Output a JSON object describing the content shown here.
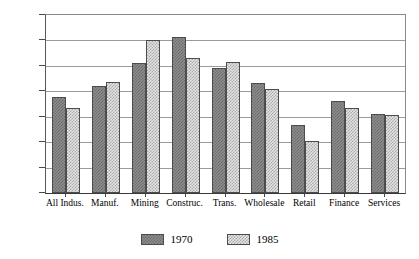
{
  "chart_data": {
    "type": "bar",
    "title": "",
    "xlabel": "",
    "ylabel": "",
    "ylim": [
      0,
      350
    ],
    "grid": true,
    "legend_position": "bottom-center",
    "y_axis_prefix": "$",
    "y_ticks": [
      0,
      50,
      100,
      150,
      200,
      250,
      300,
      350
    ],
    "y_tick_labels": [
      "0",
      "50",
      "100",
      "150",
      "200",
      "250",
      "300",
      "$350"
    ],
    "categories": [
      "All Indus.",
      "Manuf.",
      "Mining",
      "Construc.",
      "Trans.",
      "Wholesale",
      "Retail",
      "Finance",
      "Services"
    ],
    "series": [
      {
        "name": "1970",
        "color": "#8d8d8d",
        "values": [
          188,
          210,
          255,
          307,
          245,
          216,
          133,
          180,
          156
        ]
      },
      {
        "name": "1985",
        "color": "#e4e4e4",
        "values": [
          168,
          219,
          300,
          265,
          257,
          205,
          103,
          167,
          153
        ]
      }
    ]
  },
  "legend": {
    "entries": [
      {
        "label": "1970",
        "swatch": "dark-checkered-swatch"
      },
      {
        "label": "1985",
        "swatch": "light-checkered-swatch"
      }
    ]
  }
}
